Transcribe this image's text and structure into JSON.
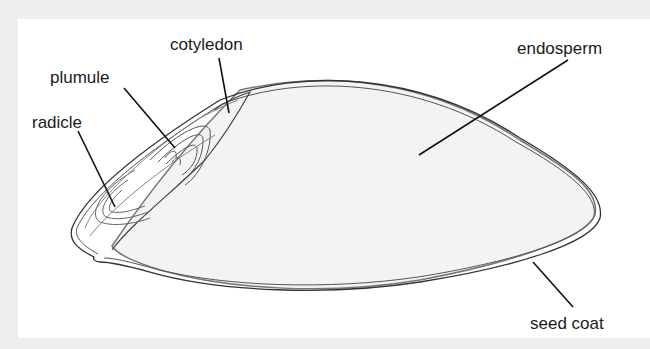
{
  "diagram": {
    "labels": {
      "cotyledon": "cotyledon",
      "plumule": "plumule",
      "radicle": "radicle",
      "endosperm": "endosperm",
      "seed_coat": "seed coat"
    },
    "colors": {
      "background": "#eeeeee",
      "panel": "#ffffff",
      "endosperm_fill": "#f4f4f4",
      "outline": "#333333",
      "leader_line": "#111111"
    }
  }
}
